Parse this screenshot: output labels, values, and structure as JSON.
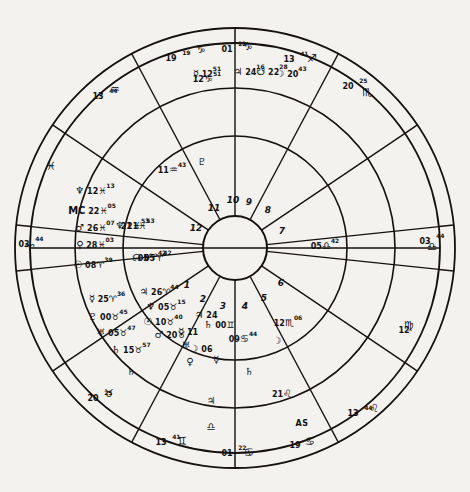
{
  "chart": {
    "center_x": 235,
    "center_y": 248,
    "radii": {
      "outer": 220,
      "ring2": 205,
      "ring3": 160,
      "ring4": 112,
      "hub": 32
    },
    "ink_color": "#15110e",
    "paper_color": "#f4f2ef"
  },
  "house_numbers": [
    {
      "n": "1",
      "x": 187,
      "y": 285
    },
    {
      "n": "2",
      "x": 203,
      "y": 299
    },
    {
      "n": "3",
      "x": 223,
      "y": 306
    },
    {
      "n": "4",
      "x": 245,
      "y": 306
    },
    {
      "n": "5",
      "x": 264,
      "y": 298
    },
    {
      "n": "6",
      "x": 281,
      "y": 283
    },
    {
      "n": "7",
      "x": 282,
      "y": 231
    },
    {
      "n": "8",
      "x": 268,
      "y": 210
    },
    {
      "n": "9",
      "x": 249,
      "y": 202
    },
    {
      "n": "10",
      "x": 233,
      "y": 200
    },
    {
      "n": "11",
      "x": 214,
      "y": 208
    },
    {
      "n": "12",
      "x": 196,
      "y": 228
    }
  ],
  "outer_cusps": [
    {
      "deg": "19",
      "sign": "♑",
      "min": "19",
      "x": 178,
      "y": 56,
      "name": "cusp-capricorn-19"
    },
    {
      "deg": "01",
      "sign": "♑",
      "min": "22",
      "x": 234,
      "y": 47,
      "name": "cusp-capricorn-01"
    },
    {
      "deg": "13",
      "sign": "♐",
      "min": "41",
      "x": 296,
      "y": 57,
      "name": "cusp-sagittarius-13"
    },
    {
      "deg": "20",
      "sign": "♏",
      "min": "25",
      "x": 355,
      "y": 84,
      "name": "cusp-scorpio-20"
    },
    {
      "deg": "03",
      "sign": "♎",
      "min": "44",
      "x": 432,
      "y": 239,
      "name": "cusp-libra-03-descendant"
    },
    {
      "deg": "12",
      "sign": "♍",
      "min": "",
      "x": 404,
      "y": 328,
      "name": "cusp-virgo-12"
    },
    {
      "deg": "13",
      "sign": "♌",
      "min": "44",
      "x": 360,
      "y": 411,
      "name": "cusp-leo-13-ascendant-side"
    },
    {
      "deg": "19",
      "sign": "♋",
      "min": "",
      "x": 295,
      "y": 443,
      "name": "cusp-cancer-19"
    },
    {
      "deg": "01",
      "sign": "♋",
      "min": "22",
      "x": 234,
      "y": 451,
      "name": "cusp-cancer-01"
    },
    {
      "deg": "13",
      "sign": "♊",
      "min": "41",
      "x": 168,
      "y": 440,
      "name": "cusp-gemini-13"
    },
    {
      "deg": "20",
      "sign": "♉",
      "min": "25",
      "x": 100,
      "y": 396,
      "name": "cusp-taurus-20"
    },
    {
      "deg": "03",
      "sign": "♈",
      "min": "44",
      "x": 31,
      "y": 242,
      "name": "cusp-aries-03-ascendant"
    },
    {
      "deg": "13",
      "sign": "♒",
      "min": "44",
      "x": 105,
      "y": 94,
      "name": "cusp-aquarius-13"
    },
    {
      "deg": "",
      "sign": "♓",
      "min": "",
      "x": 51,
      "y": 166,
      "name": "cusp-pisces-marker"
    }
  ],
  "inner_cusps": [
    {
      "deg": "12",
      "sign": "♑",
      "min": "51",
      "x": 207,
      "y": 77,
      "name": "inner-cusp-capricorn-12"
    },
    {
      "deg": "11",
      "sign": "♒",
      "min": "43",
      "x": 172,
      "y": 168,
      "name": "inner-cusp-aquarius-11"
    },
    {
      "deg": "05",
      "sign": "♎",
      "min": "42",
      "x": 325,
      "y": 244,
      "name": "inner-cusp-libra-05"
    },
    {
      "deg": "12",
      "sign": "♏",
      "min": "06",
      "x": 288,
      "y": 321,
      "name": "inner-cusp-scorpio-12"
    },
    {
      "deg": "09",
      "sign": "♋",
      "min": "44",
      "x": 243,
      "y": 337,
      "name": "inner-cusp-cancer-09"
    },
    {
      "deg": "21",
      "sign": "♌",
      "min": "",
      "x": 282,
      "y": 392,
      "name": "inner-cusp-leo-21"
    },
    {
      "deg": "05",
      "sign": "♈",
      "min": "42",
      "x": 152,
      "y": 256,
      "name": "inner-cusp-aries-05"
    },
    {
      "deg": "21",
      "sign": "♓",
      "min": "53",
      "x": 135,
      "y": 224,
      "name": "inner-cusp-pisces-21"
    }
  ],
  "planets": [
    {
      "glyph": "♆",
      "deg": "12",
      "sign": "♓",
      "min": "13",
      "x": 95,
      "y": 189,
      "name": "planet-neptune-pisces"
    },
    {
      "glyph": "MC",
      "deg": "22",
      "sign": "♓",
      "min": "05",
      "x": 92,
      "y": 209,
      "name": "planet-mc-pisces"
    },
    {
      "glyph": "♂",
      "deg": "26",
      "sign": "♓",
      "min": "07",
      "x": 95,
      "y": 226,
      "name": "planet-mars-pisces"
    },
    {
      "glyph": "♀",
      "deg": "28",
      "sign": "♓",
      "min": "03",
      "x": 95,
      "y": 243,
      "name": "planet-venus-pisces"
    },
    {
      "glyph": "☉",
      "deg": "08",
      "sign": "♈",
      "min": "39",
      "x": 93,
      "y": 263,
      "name": "planet-sun-aries"
    },
    {
      "glyph": "♆",
      "deg": "21",
      "sign": "♓",
      "min": "53",
      "x": 135,
      "y": 224,
      "name": "planet-neptune-inner"
    },
    {
      "glyph": "☊",
      "deg": "05",
      "sign": "♈",
      "min": "42",
      "x": 152,
      "y": 256,
      "name": "planet-north-node-aries"
    },
    {
      "glyph": "☿",
      "deg": "25",
      "sign": "♈",
      "min": "36",
      "x": 107,
      "y": 297,
      "name": "planet-mercury-aries"
    },
    {
      "glyph": "♇",
      "deg": "00",
      "sign": "♉",
      "min": "45",
      "x": 108,
      "y": 315,
      "name": "planet-pluto-taurus"
    },
    {
      "glyph": "♅",
      "deg": "05",
      "sign": "♉",
      "min": "47",
      "x": 116,
      "y": 331,
      "name": "planet-uranus-taurus"
    },
    {
      "glyph": "♄",
      "deg": "15",
      "sign": "♉",
      "min": "57",
      "x": 131,
      "y": 348,
      "name": "planet-saturn-taurus"
    },
    {
      "glyph": "♃",
      "deg": "26",
      "sign": "♈",
      "min": "44",
      "x": 159,
      "y": 290,
      "name": "planet-jupiter-aries"
    },
    {
      "glyph": "♆",
      "deg": "05",
      "sign": "♉",
      "min": "15",
      "x": 166,
      "y": 305,
      "name": "planet-neptune-taurus"
    },
    {
      "glyph": "☉",
      "deg": "10",
      "sign": "♉",
      "min": "40",
      "x": 163,
      "y": 320,
      "name": "planet-sun-taurus"
    },
    {
      "glyph": "♂",
      "deg": "20",
      "sign": "♉",
      "min": "",
      "x": 170,
      "y": 333,
      "name": "planet-mars-taurus"
    },
    {
      "glyph": "☿",
      "deg": "11",
      "sign": "",
      "min": "",
      "x": 188,
      "y": 330,
      "name": "planet-mercury-inner"
    },
    {
      "glyph": "♃",
      "deg": "24",
      "sign": "",
      "min": "",
      "x": 206,
      "y": 313,
      "name": "planet-jupiter-inner"
    },
    {
      "glyph": "♄",
      "deg": "00",
      "sign": "♊",
      "min": "",
      "x": 219,
      "y": 323,
      "name": "planet-saturn-gemini"
    },
    {
      "glyph": "☽",
      "deg": "06",
      "sign": "",
      "min": "",
      "x": 201,
      "y": 347,
      "name": "planet-moon-inner"
    },
    {
      "glyph": "♅",
      "deg": "",
      "sign": "",
      "min": "",
      "x": 186,
      "y": 344,
      "name": "planet-uranus-inner"
    },
    {
      "glyph": "♀",
      "deg": "",
      "sign": "",
      "min": "",
      "x": 190,
      "y": 360,
      "name": "planet-venus-inner"
    },
    {
      "glyph": "☿",
      "deg": "",
      "sign": "",
      "min": "",
      "x": 216,
      "y": 358,
      "name": "planet-mercury-lower"
    },
    {
      "glyph": "☽",
      "deg": "",
      "sign": "",
      "min": "",
      "x": 277,
      "y": 339,
      "name": "planet-moon-scorpio"
    },
    {
      "glyph": "♄",
      "deg": "",
      "sign": "",
      "min": "",
      "x": 249,
      "y": 370,
      "name": "planet-saturn-cancer"
    },
    {
      "glyph": "♃",
      "deg": "",
      "sign": "",
      "min": "",
      "x": 211,
      "y": 399,
      "name": "planet-jupiter-bottom"
    },
    {
      "glyph": "♎",
      "deg": "",
      "sign": "",
      "min": "",
      "x": 211,
      "y": 425,
      "name": "planet-libra-bottom"
    },
    {
      "glyph": "♇",
      "deg": "",
      "sign": "",
      "min": "",
      "x": 202,
      "y": 160,
      "name": "planet-pluto-aquarius"
    },
    {
      "glyph": "♄",
      "deg": "",
      "sign": "",
      "min": "",
      "x": 131,
      "y": 370,
      "name": "planet-saturn-lower-left"
    }
  ],
  "top_sector_planets": [
    {
      "glyph": "☿",
      "deg": "12",
      "min": "51",
      "x": 207,
      "y": 72,
      "name": "top-mercury-capricorn"
    },
    {
      "glyph": "♃",
      "deg": "24",
      "min": "16",
      "x": 249,
      "y": 70,
      "name": "top-jupiter-sagittarius"
    },
    {
      "glyph": "☋",
      "deg": "22",
      "min": "28",
      "x": 272,
      "y": 70,
      "name": "top-south-node-sagittarius"
    },
    {
      "glyph": "☽",
      "deg": "20",
      "min": "43",
      "x": 291,
      "y": 72,
      "name": "top-moon-sagittarius"
    }
  ],
  "axis_labels": [
    {
      "text": "AS",
      "x": 302,
      "y": 423,
      "name": "ascendant-label"
    }
  ],
  "sign_markers": [
    {
      "glyph": "♑",
      "x": 201,
      "y": 49,
      "name": "sign-capricorn-top-left"
    },
    {
      "glyph": "♑",
      "x": 248,
      "y": 46,
      "name": "sign-capricorn-top"
    },
    {
      "glyph": "♐",
      "x": 312,
      "y": 58,
      "name": "sign-sagittarius"
    },
    {
      "glyph": "♏",
      "x": 367,
      "y": 92,
      "name": "sign-scorpio"
    },
    {
      "glyph": "♎",
      "x": 432,
      "y": 246,
      "name": "sign-libra"
    },
    {
      "glyph": "♍",
      "x": 409,
      "y": 325,
      "name": "sign-virgo"
    },
    {
      "glyph": "♌",
      "x": 374,
      "y": 408,
      "name": "sign-leo"
    },
    {
      "glyph": "♋",
      "x": 310,
      "y": 441,
      "name": "sign-cancer-right"
    },
    {
      "glyph": "♋",
      "x": 249,
      "y": 452,
      "name": "sign-cancer"
    },
    {
      "glyph": "♊",
      "x": 182,
      "y": 441,
      "name": "sign-gemini"
    },
    {
      "glyph": "♉",
      "x": 109,
      "y": 393,
      "name": "sign-taurus"
    },
    {
      "glyph": "♈",
      "x": 30,
      "y": 248,
      "name": "sign-aries"
    },
    {
      "glyph": "♒",
      "x": 115,
      "y": 89,
      "name": "sign-aquarius"
    },
    {
      "glyph": "♓",
      "x": 51,
      "y": 166,
      "name": "sign-pisces"
    }
  ]
}
